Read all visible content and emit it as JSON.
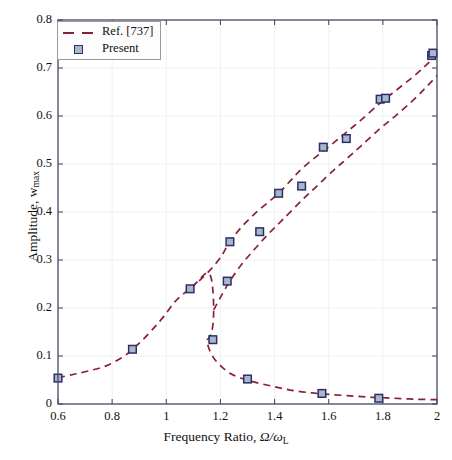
{
  "figure": {
    "background": "#ffffff",
    "plot_box": {
      "left": 58,
      "top": 20,
      "right": 437,
      "bottom": 404
    },
    "axis_color": "#4a4a6a",
    "grid_color": "#f0f0f4"
  },
  "labels": {
    "xlabel_prefix": "Frequency Ratio, ",
    "xlabel_symbol": "Ω/ω",
    "xlabel_sub": "L",
    "ylabel_prefix": "Amplitude, w",
    "ylabel_sub": "max"
  },
  "legend": {
    "position": "top-left",
    "entries": [
      {
        "label": "Ref. [737]",
        "kind": "dashed-line",
        "color": "#8a1f3d"
      },
      {
        "label": "Present",
        "kind": "square-marker",
        "face": "#aab6cc",
        "edge": "#2b2f66"
      }
    ]
  },
  "chart_data": {
    "type": "line",
    "title": "",
    "xlabel": "Frequency Ratio, Ω/ω_L",
    "ylabel": "Amplitude, w_max",
    "xlim": [
      0.6,
      2.0
    ],
    "ylim": [
      0.0,
      0.8
    ],
    "xticks": [
      0.6,
      0.8,
      1.0,
      1.2,
      1.4,
      1.6,
      1.8,
      2.0
    ],
    "xtick_labels": [
      "0.6",
      "0.8",
      "1",
      "1.2",
      "1.4",
      "1.6",
      "1.8",
      "2"
    ],
    "yticks": [
      0,
      0.1,
      0.2,
      0.3,
      0.4,
      0.5,
      0.6,
      0.7,
      0.8
    ],
    "ytick_labels": [
      "0",
      "0.1",
      "0.2",
      "0.3",
      "0.4",
      "0.5",
      "0.6",
      "0.7",
      "0.8"
    ],
    "grid": true,
    "legend_position": "upper left",
    "series": [
      {
        "name": "Ref. [737]",
        "style": "dashed",
        "color": "#8a1f3d",
        "branch": "lower-backbone",
        "x": [
          0.6,
          0.66,
          0.72,
          0.78,
          0.84,
          0.875,
          0.91,
          0.95,
          0.99,
          1.03,
          1.06,
          1.088,
          1.11,
          1.13,
          1.145,
          1.158,
          1.166,
          1.171,
          1.174,
          1.175,
          1.174,
          1.171,
          1.166,
          1.16,
          1.155,
          1.152,
          1.15,
          1.152,
          1.16,
          1.175,
          1.2,
          1.235,
          1.28,
          1.33,
          1.4,
          1.47,
          1.54,
          1.6,
          1.68,
          1.76,
          1.84,
          1.92,
          2.0
        ],
        "y": [
          0.055,
          0.062,
          0.07,
          0.08,
          0.098,
          0.114,
          0.132,
          0.156,
          0.182,
          0.212,
          0.228,
          0.24,
          0.252,
          0.264,
          0.272,
          0.272,
          0.262,
          0.244,
          0.22,
          0.196,
          0.176,
          0.16,
          0.148,
          0.14,
          0.136,
          0.134,
          0.133,
          0.126,
          0.112,
          0.096,
          0.08,
          0.064,
          0.053,
          0.045,
          0.036,
          0.028,
          0.023,
          0.02,
          0.017,
          0.014,
          0.012,
          0.01,
          0.009
        ]
      },
      {
        "name": "Ref. [737] upper",
        "style": "dashed",
        "color": "#8a1f3d",
        "branch": "upper-resonant",
        "x": [
          1.088,
          1.12,
          1.16,
          1.2,
          1.235,
          1.28,
          1.33,
          1.38,
          1.415,
          1.46,
          1.5,
          1.56,
          1.62,
          1.665,
          1.72,
          1.79,
          1.85,
          1.91,
          1.96,
          2.0
        ],
        "y": [
          0.24,
          0.256,
          0.278,
          0.305,
          0.338,
          0.37,
          0.398,
          0.422,
          0.439,
          0.466,
          0.49,
          0.518,
          0.545,
          0.566,
          0.592,
          0.627,
          0.654,
          0.681,
          0.706,
          0.728
        ]
      },
      {
        "name": "Ref. [737] second upper",
        "style": "dashed",
        "color": "#8a1f3d",
        "branch": "upper-second",
        "x": [
          1.175,
          1.2,
          1.235,
          1.28,
          1.33,
          1.38,
          1.43,
          1.5,
          1.56,
          1.62,
          1.665,
          1.72,
          1.79,
          1.85,
          1.91,
          1.96,
          2.0
        ],
        "y": [
          0.196,
          0.222,
          0.256,
          0.292,
          0.325,
          0.356,
          0.384,
          0.424,
          0.456,
          0.488,
          0.51,
          0.538,
          0.574,
          0.602,
          0.632,
          0.66,
          0.684
        ]
      },
      {
        "name": "Present",
        "style": "markers",
        "face": "#aab6cc",
        "edge": "#2b2f66",
        "points": [
          {
            "x": 0.6,
            "y": 0.054
          },
          {
            "x": 0.875,
            "y": 0.114
          },
          {
            "x": 1.088,
            "y": 0.24
          },
          {
            "x": 1.172,
            "y": 0.134
          },
          {
            "x": 1.225,
            "y": 0.256
          },
          {
            "x": 1.235,
            "y": 0.338
          },
          {
            "x": 1.3,
            "y": 0.052
          },
          {
            "x": 1.345,
            "y": 0.359
          },
          {
            "x": 1.415,
            "y": 0.439
          },
          {
            "x": 1.5,
            "y": 0.454
          },
          {
            "x": 1.575,
            "y": 0.022
          },
          {
            "x": 1.58,
            "y": 0.535
          },
          {
            "x": 1.665,
            "y": 0.553
          },
          {
            "x": 1.785,
            "y": 0.012
          },
          {
            "x": 1.79,
            "y": 0.635
          },
          {
            "x": 1.81,
            "y": 0.637
          },
          {
            "x": 1.98,
            "y": 0.726
          },
          {
            "x": 1.985,
            "y": 0.731
          }
        ]
      }
    ]
  }
}
